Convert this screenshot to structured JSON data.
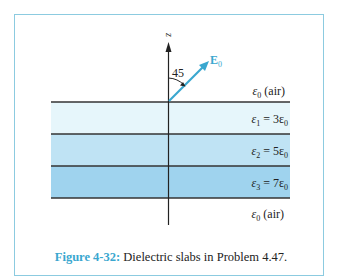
{
  "figure": {
    "axis_label": "z",
    "vector_label": "E",
    "vector_subscript": "0",
    "angle_label": "45",
    "layers": [
      {
        "name": "air-top",
        "symbol": "ε",
        "sub": "0",
        "rest": " (air)",
        "color": "#ffffff"
      },
      {
        "name": "slab-1",
        "symbol": "ε",
        "sub": "1",
        "rest": " = 3ε",
        "rest_sub": "0",
        "color": "#e6f6fb"
      },
      {
        "name": "slab-2",
        "symbol": "ε",
        "sub": "2",
        "rest": " = 5ε",
        "rest_sub": "0",
        "color": "#bfe3f4"
      },
      {
        "name": "slab-3",
        "symbol": "ε",
        "sub": "3",
        "rest": " = 7ε",
        "rest_sub": "0",
        "color": "#9fd3ee"
      },
      {
        "name": "air-bottom",
        "symbol": "ε",
        "sub": "0",
        "rest": " (air)",
        "color": "#ffffff"
      }
    ],
    "colors": {
      "frame": "#8ccbe0",
      "vector": "#3aa7cf",
      "lines": "#222222",
      "caption_label": "#3aa7cf"
    }
  },
  "caption": {
    "label": "Figure 4-32:",
    "text": " Dielectric slabs in Problem 4.47."
  }
}
